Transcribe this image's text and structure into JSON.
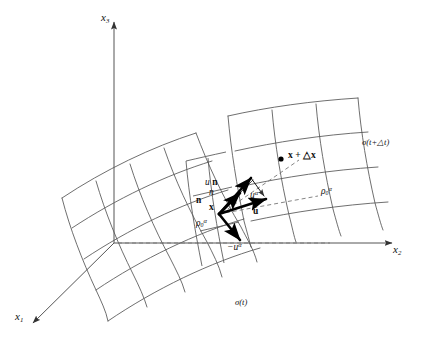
{
  "figure": {
    "type": "geometric-diagram",
    "background_color": "#ffffff",
    "line_color": "#555555",
    "vector_color": "#000000",
    "dashed_color": "#777777"
  },
  "axes": {
    "x1": {
      "base": "x",
      "sub": "1",
      "label": "x1"
    },
    "x2": {
      "base": "x",
      "sub": "2",
      "label": "x2"
    },
    "x3": {
      "base": "x",
      "sub": "3",
      "label": "x3"
    }
  },
  "surfaces": [
    {
      "name": "sigma-t",
      "base": "σ(",
      "arg": "t",
      "close": ")",
      "label": "σ(t)"
    },
    {
      "name": "sigma-t-plus-dt",
      "base": "σ(",
      "arg": "t+△t",
      "close": ")",
      "label": "σ(t+△t)"
    }
  ],
  "points": [
    {
      "name": "point-x",
      "label": "x"
    },
    {
      "name": "point-x-plus-dx",
      "label": "x + △x"
    }
  ],
  "vectors": [
    {
      "name": "vector-u-n",
      "base": "u",
      "bold": "n",
      "label": "u n"
    },
    {
      "name": "vector-n-italic",
      "base": "n",
      "label": "n"
    },
    {
      "name": "vector-n-bold",
      "base": "n",
      "label": "n"
    },
    {
      "name": "vector-u-alpha",
      "base": "u",
      "sup": "α",
      "label": "uα"
    },
    {
      "name": "vector-u-bold",
      "base": "u",
      "label": "u"
    },
    {
      "name": "vector-minus-u-alpha",
      "base": "−u",
      "sup": "α",
      "label": "−uα"
    }
  ],
  "density_labels": [
    {
      "name": "rho-zero-alpha-left",
      "base": "ρ",
      "sub": "0",
      "sup": "α",
      "label": "ρ0α"
    },
    {
      "name": "rho-zero-alpha-right",
      "base": "ρ",
      "sub": "0",
      "sup": "α",
      "label": "ρ0α"
    }
  ]
}
